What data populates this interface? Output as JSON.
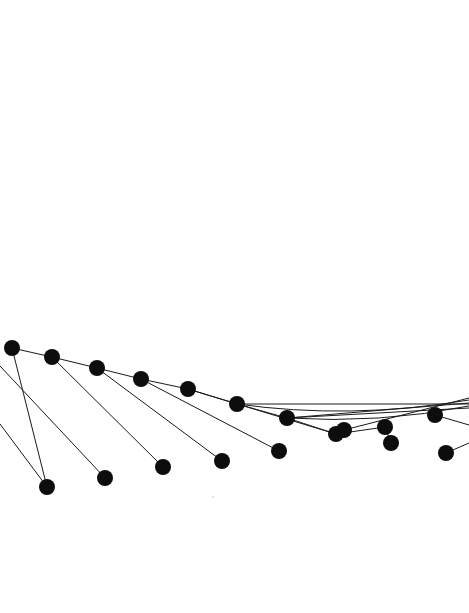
{
  "figure": {
    "title": "",
    "background_color": "#ffffff",
    "width": 469,
    "height": 613
  },
  "chart_data": {
    "type": "scatter",
    "title": "",
    "subtitle": "",
    "xlabel": "",
    "ylabel": "",
    "xlim": [
      0,
      469
    ],
    "ylim": [
      613,
      0
    ],
    "grid": false,
    "legend": null,
    "axes_visible": false,
    "tick_labels_x": [],
    "tick_labels_y": [],
    "annotations": [],
    "style": {
      "marker_color": "#0d0d0d",
      "marker_shape": "circle",
      "marker_radius": 8.0,
      "line_color": "#1a1a1a",
      "line_width": 1.0
    },
    "series": [
      {
        "name": "upper-arc-nodes",
        "marker_radius": 8.0,
        "points": [
          {
            "id": "u1",
            "x": 12,
            "y": 348
          },
          {
            "id": "u2",
            "x": 52,
            "y": 357
          },
          {
            "id": "u3",
            "x": 97,
            "y": 368
          },
          {
            "id": "u4",
            "x": 141,
            "y": 379
          },
          {
            "id": "u5",
            "x": 188,
            "y": 389
          },
          {
            "id": "u6",
            "x": 237,
            "y": 404
          },
          {
            "id": "u7",
            "x": 287,
            "y": 418
          },
          {
            "id": "u8",
            "x": 336,
            "y": 434
          },
          {
            "id": "u9",
            "x": 344,
            "y": 430
          },
          {
            "id": "u10",
            "x": 385,
            "y": 427
          },
          {
            "id": "u11",
            "x": 435,
            "y": 415
          }
        ]
      },
      {
        "name": "lower-nodes",
        "marker_radius": 8.0,
        "points": [
          {
            "id": "l1",
            "x": 47,
            "y": 487
          },
          {
            "id": "l2",
            "x": 105,
            "y": 478
          },
          {
            "id": "l3",
            "x": 163,
            "y": 467
          },
          {
            "id": "l4",
            "x": 222,
            "y": 461
          },
          {
            "id": "l5",
            "x": 279,
            "y": 451
          },
          {
            "id": "l6",
            "x": 391,
            "y": 443
          },
          {
            "id": "l7",
            "x": 446,
            "y": 453
          }
        ]
      }
    ],
    "links": [
      {
        "name": "link-u1-l1",
        "x1": 12,
        "y1": 348,
        "x2": 47,
        "y2": 487
      },
      {
        "name": "link-edge-l2",
        "x1": 0,
        "y1": 366,
        "x2": 105,
        "y2": 478
      },
      {
        "name": "link-edge-l1",
        "x1": 0,
        "y1": 424,
        "x2": 47,
        "y2": 487
      },
      {
        "name": "link-u2-l3",
        "x1": 52,
        "y1": 357,
        "x2": 163,
        "y2": 467
      },
      {
        "name": "link-u3-l4",
        "x1": 97,
        "y1": 368,
        "x2": 222,
        "y2": 461
      },
      {
        "name": "link-u4-l5",
        "x1": 141,
        "y1": 379,
        "x2": 279,
        "y2": 451
      },
      {
        "name": "link-u5-l8",
        "x1": 188,
        "y1": 389,
        "x2": 336,
        "y2": 434
      },
      {
        "name": "link-u6-chain",
        "x1": 237,
        "y1": 404,
        "x2": 469,
        "y2": 404
      },
      {
        "name": "link-u7-chain",
        "x1": 287,
        "y1": 418,
        "x2": 469,
        "y2": 408
      },
      {
        "name": "link-u8-u10",
        "x1": 336,
        "y1": 434,
        "x2": 385,
        "y2": 427
      },
      {
        "name": "link-u9-edge",
        "x1": 344,
        "y1": 430,
        "x2": 469,
        "y2": 398
      },
      {
        "name": "link-u10-l6",
        "x1": 385,
        "y1": 427,
        "x2": 391,
        "y2": 443
      },
      {
        "name": "link-u11-edge",
        "x1": 435,
        "y1": 415,
        "x2": 469,
        "y2": 425
      },
      {
        "name": "link-l7-edge",
        "x1": 446,
        "y1": 453,
        "x2": 469,
        "y2": 443
      },
      {
        "name": "link-arc-long",
        "x1": 287,
        "y1": 418,
        "x2": 469,
        "y2": 403
      }
    ],
    "arcs": [
      {
        "name": "upper-chain-curve",
        "path": "M 12 348 L 52 357 L 97 368 L 141 379 L 188 389 L 237 404 L 287 418 L 336 434"
      },
      {
        "name": "right-sweep-curve",
        "path": "M 237 404 Q 350 420 469 400"
      },
      {
        "name": "right-sweep-curve-2",
        "path": "M 287 418 Q 380 424 469 406"
      }
    ],
    "speck": {
      "name": "faint-speck",
      "x": 213,
      "y": 497,
      "radius": 1.2,
      "opacity": 0.12
    }
  }
}
